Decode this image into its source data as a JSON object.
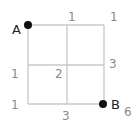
{
  "diagram": {
    "type": "grid-path-count",
    "grid_size": "2x2",
    "start_point": "A",
    "end_point": "B",
    "colors": {
      "grid": "#c8c8c8",
      "point": "#111111",
      "number": "#8a8a8a"
    },
    "numbers": [
      {
        "value": "1",
        "pos": "top-middle"
      },
      {
        "value": "1",
        "pos": "top-right"
      },
      {
        "value": "1",
        "pos": "middle-left"
      },
      {
        "value": "2",
        "pos": "center"
      },
      {
        "value": "3",
        "pos": "middle-right"
      },
      {
        "value": "1",
        "pos": "bottom-left"
      },
      {
        "value": "3",
        "pos": "bottom-middle"
      },
      {
        "value": "6",
        "pos": "bottom-right"
      }
    ]
  }
}
